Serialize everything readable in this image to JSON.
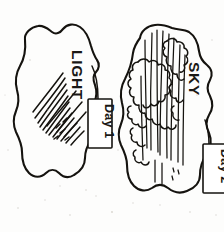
{
  "image": {
    "kind": "hand-drawn-scanned-diagram",
    "width": 224,
    "height": 232,
    "background_color": "#fdfdfc",
    "ink_color": "#15130f"
  },
  "shapes": [
    {
      "id": "light-blob",
      "label": "LIGHT",
      "label_rotation_deg": 90,
      "description": "irregular blob with fan of radiating rays",
      "tag": {
        "id": "day-1-tag",
        "label": "Day 1",
        "rotation_deg": 90
      }
    },
    {
      "id": "sky-blob",
      "label": "SKY",
      "label_rotation_deg": 90,
      "description": "irregular blob with cloud outlines and vertical streaks",
      "tag": {
        "id": "day-2-tag",
        "label": "Day 2",
        "rotation_deg": 90
      }
    }
  ],
  "labels": {
    "light": "LIGHT",
    "sky": "SKY",
    "day1": "Day 1",
    "day2": "Day 2"
  },
  "icons": {
    "ray_fan": "radiating-rays-icon",
    "cloud_cluster": "cloud-cluster-icon"
  }
}
